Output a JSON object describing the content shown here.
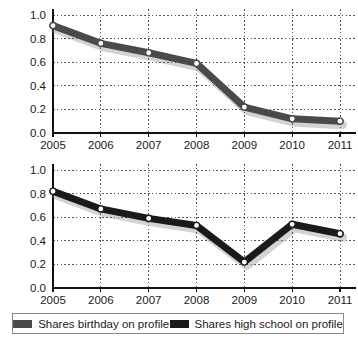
{
  "chart_data": [
    {
      "type": "line",
      "title": "",
      "xlabel": "",
      "ylabel": "",
      "categories": [
        "2005",
        "2006",
        "2007",
        "2008",
        "2009",
        "2010",
        "2011"
      ],
      "x": [
        2005,
        2006,
        2007,
        2008,
        2009,
        2010,
        2011
      ],
      "series": [
        {
          "name": "Shares birthday on profile",
          "color": "#4a4a4a",
          "values": [
            0.91,
            0.76,
            0.68,
            0.59,
            0.22,
            0.12,
            0.1
          ]
        }
      ],
      "ylim": [
        0.0,
        1.0
      ],
      "yticks": [
        "1.0",
        "0.8",
        "0.6",
        "0.4",
        "0.2",
        "0.0"
      ],
      "ytick_values": [
        1.0,
        0.8,
        0.6,
        0.4,
        0.2,
        0.0
      ],
      "grid": true,
      "legend_position": "bottom"
    },
    {
      "type": "line",
      "title": "",
      "xlabel": "",
      "ylabel": "",
      "categories": [
        "2005",
        "2006",
        "2007",
        "2008",
        "2009",
        "2010",
        "2011"
      ],
      "x": [
        2005,
        2006,
        2007,
        2008,
        2009,
        2010,
        2011
      ],
      "series": [
        {
          "name": "Shares high school on profile",
          "color": "#1a1a1a",
          "values": [
            0.82,
            0.67,
            0.59,
            0.53,
            0.22,
            0.54,
            0.46
          ]
        }
      ],
      "ylim": [
        0.0,
        1.0
      ],
      "yticks": [
        "1.0",
        "0.8",
        "0.6",
        "0.4",
        "0.2",
        "0.0"
      ],
      "ytick_values": [
        1.0,
        0.8,
        0.6,
        0.4,
        0.2,
        0.0
      ],
      "grid": true,
      "legend_position": "bottom"
    }
  ],
  "legend": {
    "entries": [
      {
        "label": "Shares birthday on profile",
        "color": "#4a4a4a"
      },
      {
        "label": "Shares high school on profile",
        "color": "#1a1a1a"
      }
    ]
  }
}
